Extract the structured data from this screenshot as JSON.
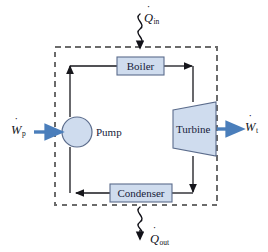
{
  "figure": {
    "kind": "rankine-cycle-block-diagram",
    "background": "#ffffff",
    "boundary": {
      "name": "control-volume-boundary",
      "style": "dashed",
      "color": "#6b6b6b",
      "x": 55,
      "y": 47,
      "width": 162,
      "height": 158
    },
    "colors": {
      "component_fill": "#cfdcee",
      "component_stroke": "#5b6c8c",
      "work_arrow": "#4a7ebb",
      "flow_line": "#17171c",
      "heat_squiggle": "#111118",
      "label_text": "#16213a"
    }
  },
  "components": [
    {
      "name": "boiler",
      "label": "Boiler",
      "shape": "rect",
      "x": 117,
      "y": 57,
      "width": 47,
      "height": 18
    },
    {
      "name": "condenser",
      "label": "Condenser",
      "shape": "rect",
      "x": 110,
      "y": 184,
      "width": 62,
      "height": 18
    },
    {
      "name": "pump",
      "label": "Pump",
      "shape": "circle",
      "cx": 77,
      "cy": 132,
      "r": 15
    },
    {
      "name": "turbine",
      "label": "Turbine",
      "shape": "trapezoid",
      "x": 172,
      "y": 102,
      "width": 45,
      "height": 54
    }
  ],
  "annotations": {
    "heat_in": {
      "name": "heat-input",
      "symbol": "Q",
      "dot": "˙",
      "subscript": "in",
      "text": "Q̇in",
      "direction": "into-boundary",
      "arrow_at": {
        "x": 140,
        "y": 47
      }
    },
    "heat_out": {
      "name": "heat-rejected",
      "symbol": "Q",
      "dot": "˙",
      "subscript": "out",
      "text": "Q̇out",
      "direction": "out-of-boundary",
      "arrow_at": {
        "x": 140,
        "y": 238
      }
    },
    "work_pump": {
      "name": "pump-work-input",
      "symbol": "W",
      "dot": "˙",
      "subscript": "p",
      "text": "Ẇp",
      "direction": "into-pump",
      "arrow_from": {
        "x": 33,
        "y": 132
      },
      "arrow_to": {
        "x": 62,
        "y": 132
      }
    },
    "work_turbine": {
      "name": "turbine-work-output",
      "symbol": "W",
      "dot": "˙",
      "subscript": "t",
      "text": "Ẇt",
      "direction": "out-of-turbine",
      "arrow_from": {
        "x": 217,
        "y": 129
      },
      "arrow_to": {
        "x": 243,
        "y": 129
      }
    }
  },
  "flow_path": {
    "name": "working-fluid-loop",
    "direction": "clockwise",
    "segments": [
      {
        "from": "pump",
        "to": "boiler",
        "arrowhead_at": {
          "x": 70,
          "y": 66
        },
        "orientation": "vertical-up"
      },
      {
        "from": "boiler",
        "to": "turbine",
        "arrowhead_at": {
          "x": 193,
          "y": 66
        },
        "orientation": "horizontal-right"
      },
      {
        "from": "turbine",
        "to": "condenser",
        "arrowhead_at": {
          "x": 193,
          "y": 193
        },
        "orientation": "vertical-down"
      },
      {
        "from": "condenser",
        "to": "pump",
        "arrowhead_at": {
          "x": 75,
          "y": 193
        },
        "orientation": "horizontal-left"
      }
    ]
  }
}
